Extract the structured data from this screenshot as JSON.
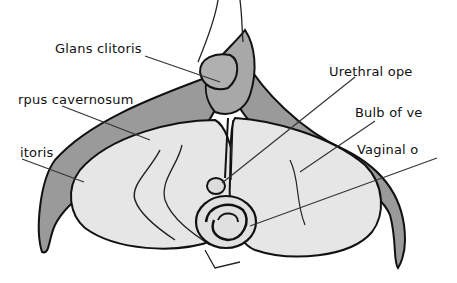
{
  "diagram": {
    "type": "anatomical-illustration",
    "colors": {
      "background": "#ffffff",
      "outline": "#111111",
      "crura_fill": "#9a9a9a",
      "bulb_fill": "#e6e6e6",
      "leader_line": "#333333"
    },
    "labels": [
      {
        "id": "glans",
        "text": "Glans clitoris",
        "x": 55,
        "y": 42
      },
      {
        "id": "corpus",
        "text": "rpus cavernosum",
        "x": 18,
        "y": 93
      },
      {
        "id": "crus",
        "text": "itoris",
        "x": 20,
        "y": 146
      },
      {
        "id": "urethral",
        "text": "Urethral ope",
        "x": 329,
        "y": 65
      },
      {
        "id": "bulb",
        "text": "Bulb of ve",
        "x": 355,
        "y": 106
      },
      {
        "id": "vaginal",
        "text": "Vaginal o",
        "x": 357,
        "y": 143
      }
    ]
  }
}
